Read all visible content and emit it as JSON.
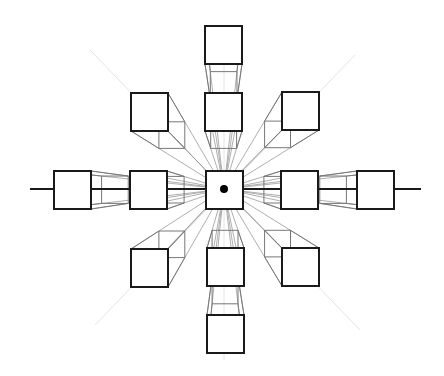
{
  "diagram": {
    "type": "one-point-perspective",
    "vanishing_point": {
      "x": 224,
      "y": 189,
      "r": 4
    },
    "horizon": {
      "x1": 30,
      "x2": 421,
      "y": 189
    },
    "depth_factor": 0.3,
    "guides": [
      {
        "x1": 224,
        "y1": 40,
        "x2": 224,
        "y2": 360
      },
      {
        "x1": 90,
        "y1": 50,
        "x2": 360,
        "y2": 330
      },
      {
        "x1": 355,
        "y1": 55,
        "x2": 95,
        "y2": 325
      }
    ],
    "cubes": [
      {
        "id": "top-far",
        "x": 205,
        "y": 26,
        "w": 37,
        "h": 38,
        "depth": 0.28
      },
      {
        "id": "top-near",
        "x": 205,
        "y": 93,
        "w": 37,
        "h": 38,
        "depth": 0.3
      },
      {
        "id": "upper-left",
        "x": 131,
        "y": 93,
        "w": 37,
        "h": 38,
        "depth": 0.3
      },
      {
        "id": "upper-right",
        "x": 282,
        "y": 92,
        "w": 37,
        "h": 38,
        "depth": 0.3
      },
      {
        "id": "mid-far-left",
        "x": 54,
        "y": 171,
        "w": 37,
        "h": 38,
        "depth": 0.28
      },
      {
        "id": "mid-left",
        "x": 130,
        "y": 171,
        "w": 37,
        "h": 38,
        "depth": 0.3
      },
      {
        "id": "center",
        "x": 206,
        "y": 171,
        "w": 37,
        "h": 38,
        "depth": 0
      },
      {
        "id": "mid-right",
        "x": 281,
        "y": 171,
        "w": 37,
        "h": 38,
        "depth": 0.3
      },
      {
        "id": "mid-far-right",
        "x": 357,
        "y": 171,
        "w": 37,
        "h": 38,
        "depth": 0.28
      },
      {
        "id": "lower-left",
        "x": 131,
        "y": 249,
        "w": 37,
        "h": 38,
        "depth": 0.3
      },
      {
        "id": "lower-center",
        "x": 207,
        "y": 248,
        "w": 37,
        "h": 38,
        "depth": 0.3
      },
      {
        "id": "lower-right",
        "x": 282,
        "y": 248,
        "w": 37,
        "h": 38,
        "depth": 0.3
      },
      {
        "id": "bottom",
        "x": 207,
        "y": 315,
        "w": 37,
        "h": 38,
        "depth": 0.3
      }
    ]
  }
}
